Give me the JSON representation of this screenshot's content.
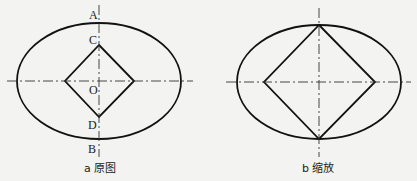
{
  "figures": [
    {
      "id": "a",
      "caption": "a 原图",
      "points": {
        "A": "A",
        "B": "B",
        "C": "C",
        "D": "D",
        "O": "O"
      },
      "ellipse": {
        "cx": 99,
        "cy": 81,
        "rx": 82,
        "ry": 58
      },
      "diamond": {
        "top": [
          99,
          45
        ],
        "right": [
          134,
          81
        ],
        "bottom": [
          99,
          117
        ],
        "left": [
          65,
          81
        ]
      }
    },
    {
      "id": "b",
      "caption": "b 缩放",
      "ellipse": {
        "cx": 319,
        "cy": 82,
        "rx": 82,
        "ry": 57
      },
      "diamond": {
        "top": [
          319,
          25
        ],
        "right": [
          375,
          82
        ],
        "bottom": [
          319,
          139
        ],
        "left": [
          264,
          82
        ]
      }
    }
  ]
}
